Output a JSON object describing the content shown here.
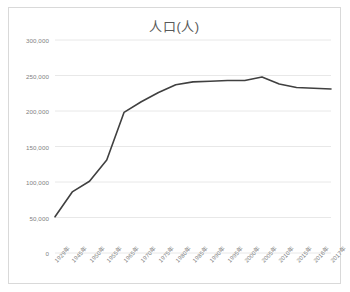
{
  "chart_data": {
    "type": "line",
    "title": "人口(人)",
    "xlabel": "",
    "ylabel": "",
    "categories": [
      "1929年",
      "1945年",
      "1950年",
      "1955年",
      "1965年",
      "1970年",
      "1975年",
      "1980年",
      "1985年",
      "1990年",
      "1995年",
      "2000年",
      "2005年",
      "2010年",
      "2015年",
      "2016年",
      "2017年"
    ],
    "values": [
      51000,
      86000,
      101000,
      131000,
      198000,
      213000,
      226000,
      237000,
      241000,
      242000,
      243000,
      243000,
      248000,
      238000,
      233000,
      232000,
      231000
    ],
    "series": [
      {
        "name": "人口(人)",
        "values": [
          51000,
          86000,
          101000,
          131000,
          198000,
          213000,
          226000,
          237000,
          241000,
          242000,
          243000,
          243000,
          248000,
          238000,
          233000,
          232000,
          231000
        ]
      }
    ],
    "ylim": [
      0,
      300000
    ],
    "yticks": [
      0,
      50000,
      100000,
      150000,
      200000,
      250000,
      300000
    ],
    "ytick_labels": [
      "0",
      "50,000",
      "100,000",
      "150,000",
      "200,000",
      "250,000",
      "300,000"
    ],
    "grid": true,
    "legend": false,
    "legend_position": "none",
    "line_color": "#404040",
    "grid_color": "#e8e8e8",
    "text_color": "#7f7f7f",
    "border_color": "#d9d9d9"
  }
}
